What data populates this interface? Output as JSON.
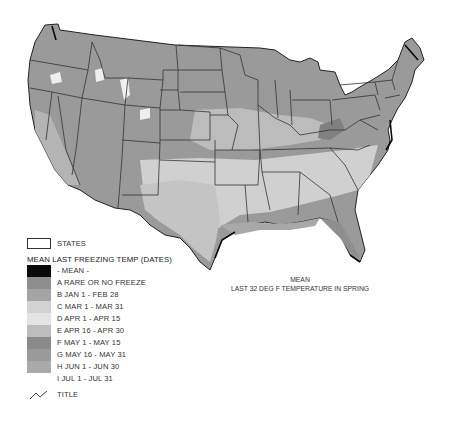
{
  "map": {
    "subject": "Mean last 32 deg F temperature in spring (contiguous United States)",
    "caption_line1": "MEAN",
    "caption_line2": "LAST 32 DEG F  TEMPERATURE IN SPRING"
  },
  "legend": {
    "states_label": "STATES",
    "title": "MEAN LAST FREEZING TEMP (DATES)",
    "classes": [
      {
        "code": "",
        "label": "- MEAN -",
        "color": "#0a0a0a"
      },
      {
        "code": "A",
        "label": "A RARE OR NO FREEZE",
        "color": "#8e8e8e"
      },
      {
        "code": "B",
        "label": "B JAN 1 - FEB 28",
        "color": "#a4a4a4"
      },
      {
        "code": "C",
        "label": "C MAR 1 - MAR 31",
        "color": "#d2d2d2"
      },
      {
        "code": "D",
        "label": "D APR 1 - APR 15",
        "color": "#e4e4e4"
      },
      {
        "code": "E",
        "label": "E APR 16 - APR 30",
        "color": "#bdbdbd"
      },
      {
        "code": "F",
        "label": "F MAY 1 - MAY 15",
        "color": "#8a8a8a"
      },
      {
        "code": "G",
        "label": "G MAY 16 - MAY 31",
        "color": "#9a9a9a"
      },
      {
        "code": "H",
        "label": "H JUN 1 - JUN 30",
        "color": "#aaaaaa"
      },
      {
        "code": "I",
        "label": "I JUL 1 - JUL 31",
        "color": "#ffffff"
      }
    ],
    "title_line_label": "TITLE"
  }
}
